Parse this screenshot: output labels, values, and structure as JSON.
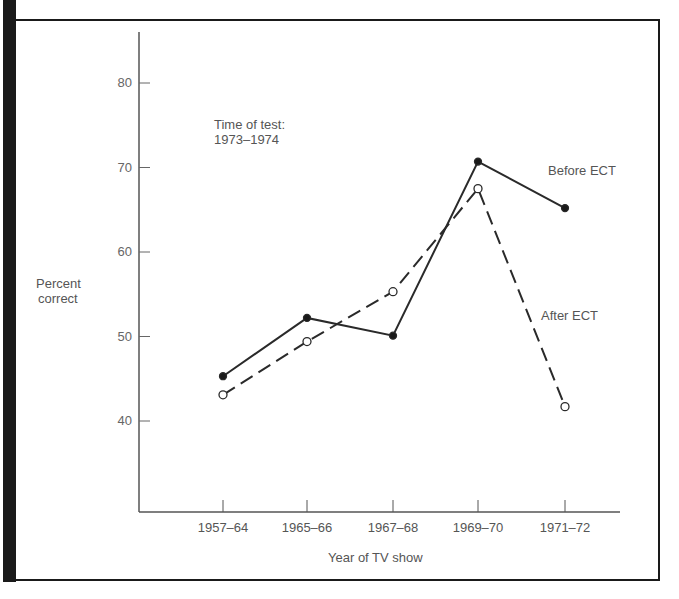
{
  "chart_data": {
    "type": "line",
    "title": "",
    "annotation": {
      "line1": "Time of test:",
      "line2": "1973–1974"
    },
    "xlabel": "Year of TV show",
    "ylabel": [
      "Percent",
      "correct"
    ],
    "categories": [
      "1957–64",
      "1965–66",
      "1967–68",
      "1969–70",
      "1971–72"
    ],
    "y_ticks": [
      "80",
      "70",
      "60",
      "50",
      "40"
    ],
    "ylim": [
      30,
      85
    ],
    "grid": false,
    "legend_position": "inline labels",
    "series": [
      {
        "name": "Before ECT",
        "style": "solid, filled circle markers",
        "values": [
          45.3,
          52.2,
          50.1,
          70.7,
          65.2
        ]
      },
      {
        "name": "After ECT",
        "style": "dashed, open circle markers",
        "values": [
          43.1,
          49.4,
          55.3,
          67.5,
          41.7
        ]
      }
    ]
  }
}
